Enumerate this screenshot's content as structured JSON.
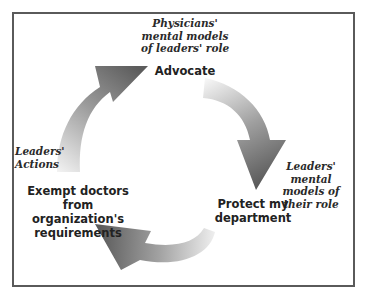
{
  "diagram": {
    "type": "reinforcing-loop",
    "colors": {
      "frame": "#5a5a5a",
      "arrow_dark": "#5e5e5e",
      "arrow_light": "#f2f2f2",
      "text": "#222222"
    },
    "labels": {
      "physicians_models": [
        "Physicians'",
        "mental models",
        "of leaders' role"
      ],
      "advocate": "Advocate",
      "leaders_models": [
        "Leaders' mental",
        "models of",
        "their role"
      ],
      "protect": [
        "Protect my",
        "department"
      ],
      "exempt": [
        "Exempt doctors from",
        "organization's",
        "requirements"
      ],
      "leaders_actions": [
        "Leaders'",
        "Actions"
      ]
    },
    "arrows": [
      {
        "from": "Leaders' Actions",
        "to": "Advocate",
        "direction": "clockwise"
      },
      {
        "from": "Advocate",
        "to": "Protect my department",
        "direction": "clockwise"
      },
      {
        "from": "Protect my department",
        "to": "Exempt doctors from organization's requirements",
        "direction": "clockwise"
      }
    ]
  }
}
